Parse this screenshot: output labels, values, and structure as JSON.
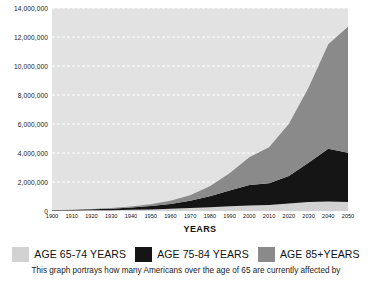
{
  "chart_data": {
    "type": "area",
    "stacked": true,
    "title": "",
    "xlabel": "YEARS",
    "ylabel": "",
    "grid": true,
    "gridline_style": "dashed-white-horizontal",
    "legend_position": "bottom",
    "xlim": [
      1900,
      2050
    ],
    "ylim": [
      0,
      14000000
    ],
    "ytick_step": 2000000,
    "x": [
      1900,
      1910,
      1920,
      1930,
      1940,
      1950,
      1960,
      1970,
      1980,
      1990,
      2000,
      2010,
      2020,
      2030,
      2040,
      2050
    ],
    "categories": [
      "1900",
      "1910",
      "1920",
      "1930",
      "1940",
      "1950",
      "1960",
      "1970",
      "1980",
      "1990",
      "2000",
      "2010",
      "2020",
      "2030",
      "2040",
      "2050"
    ],
    "ytick_labels": [
      "0",
      "2,000,000",
      "4,000,000",
      "6,000,000",
      "8,000,000",
      "10,000,000",
      "12,000,000",
      "14,000,000"
    ],
    "ytick_values": [
      0,
      2000000,
      4000000,
      6000000,
      8000000,
      10000000,
      12000000,
      14000000
    ],
    "series": [
      {
        "name": "AGE 65-74 YEARS",
        "color": "#d2d2d2",
        "values": [
          20000,
          30000,
          45000,
          60000,
          85000,
          110000,
          150000,
          200000,
          260000,
          320000,
          380000,
          420000,
          520000,
          620000,
          650000,
          620000
        ]
      },
      {
        "name": "AGE 75-84 YEARS",
        "color": "#151515",
        "values": [
          30000,
          45000,
          70000,
          100000,
          150000,
          230000,
          340000,
          500000,
          760000,
          1100000,
          1420000,
          1500000,
          1900000,
          2700000,
          3650000,
          3400000
        ]
      },
      {
        "name": "AGE 85+ YEARS",
        "color": "#8a8a8a",
        "values": [
          10000,
          15000,
          25000,
          40000,
          70000,
          120000,
          210000,
          380000,
          680000,
          1180000,
          1900000,
          2480000,
          3580000,
          5180000,
          7200000,
          8680000
        ]
      }
    ],
    "totals": [
      60000,
      90000,
      140000,
      200000,
      305000,
      460000,
      700000,
      1080000,
      1700000,
      2600000,
      3700000,
      4400000,
      6000000,
      8500000,
      11500000,
      12700000
    ]
  },
  "axis": {
    "x_title": "YEARS"
  },
  "legend": {
    "items": [
      {
        "label": "AGE 65-74 YEARS",
        "color": "#d2d2d2"
      },
      {
        "label": "AGE 75-84 YEARS",
        "color": "#151515"
      },
      {
        "label": "AGE 85+YEARS",
        "color": "#8a8a8a"
      }
    ]
  },
  "caption": {
    "text": "This graph portrays how many Americans over the age of 65 are currently affected by"
  },
  "colors": {
    "plot_background": "#e2e2e2",
    "gridline": "#ffffff",
    "page_background": "#ffffff",
    "text": "#111111"
  }
}
